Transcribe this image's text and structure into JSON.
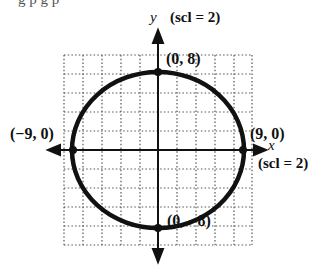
{
  "diagram": {
    "type": "ellipse-graph",
    "cropped_top_text": "g p   g p",
    "y_axis": {
      "label": "y",
      "scale_note": "(scl = 2)"
    },
    "x_axis": {
      "label": "x",
      "scale_note": "(scl = 2)"
    },
    "points": [
      {
        "id": "top",
        "label": "(0, 8)",
        "x": 0,
        "y": 8
      },
      {
        "id": "bottom",
        "label": "(0, −8)",
        "x": 0,
        "y": -8
      },
      {
        "id": "left",
        "label": "(−9, 0)",
        "x": -9,
        "y": 0
      },
      {
        "id": "right",
        "label": "(9, 0)",
        "x": 9,
        "y": 0
      }
    ],
    "curve": {
      "shape": "ellipse",
      "center": [
        0,
        0
      ],
      "semi_major_x": 9,
      "semi_minor_y": 8
    },
    "grid": {
      "style": "dotted",
      "x_range": [
        -10,
        10
      ],
      "y_range": [
        -10,
        10
      ],
      "step": 2
    },
    "colors": {
      "stroke": "#111111",
      "grid": "#555555",
      "background": "#ffffff"
    }
  }
}
